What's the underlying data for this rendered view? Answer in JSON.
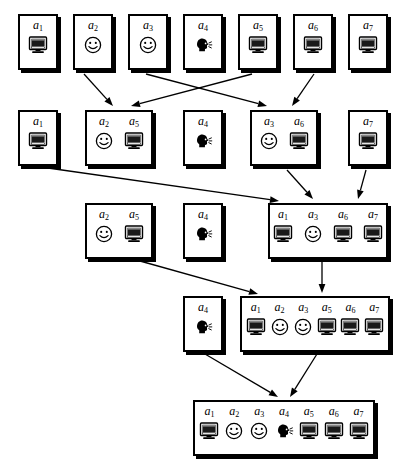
{
  "diagram": {
    "type": "clustering-dendrogram",
    "agents": [
      {
        "id": "a1",
        "label": "a",
        "sub": "1",
        "icon": "monitor-icon"
      },
      {
        "id": "a2",
        "label": "a",
        "sub": "2",
        "icon": "smiley-icon"
      },
      {
        "id": "a3",
        "label": "a",
        "sub": "3",
        "icon": "smiley-icon"
      },
      {
        "id": "a4",
        "label": "a",
        "sub": "4",
        "icon": "talking-head-icon"
      },
      {
        "id": "a5",
        "label": "a",
        "sub": "5",
        "icon": "monitor-icon"
      },
      {
        "id": "a6",
        "label": "a",
        "sub": "6",
        "icon": "monitor-icon"
      },
      {
        "id": "a7",
        "label": "a",
        "sub": "7",
        "icon": "monitor-icon"
      }
    ],
    "colors": {
      "stroke": "#000000",
      "fill": "#ffffff",
      "shadow": "#000000"
    },
    "levels": [
      {
        "level": 1,
        "y": 14,
        "height": 56,
        "clusters": [
          {
            "name": "cluster-a1",
            "x": 18,
            "width": 40,
            "members": [
              "a1"
            ]
          },
          {
            "name": "cluster-a2",
            "x": 73,
            "width": 40,
            "members": [
              "a2"
            ]
          },
          {
            "name": "cluster-a3",
            "x": 128,
            "width": 40,
            "members": [
              "a3"
            ]
          },
          {
            "name": "cluster-a4",
            "x": 183,
            "width": 40,
            "members": [
              "a4"
            ]
          },
          {
            "name": "cluster-a5",
            "x": 238,
            "width": 40,
            "members": [
              "a5"
            ]
          },
          {
            "name": "cluster-a6",
            "x": 293,
            "width": 40,
            "members": [
              "a6"
            ]
          },
          {
            "name": "cluster-a7",
            "x": 348,
            "width": 40,
            "members": [
              "a7"
            ]
          }
        ]
      },
      {
        "level": 2,
        "y": 110,
        "height": 56,
        "clusters": [
          {
            "name": "cluster-a1",
            "x": 18,
            "width": 40,
            "members": [
              "a1"
            ]
          },
          {
            "name": "cluster-a2-a5",
            "x": 85,
            "width": 68,
            "members": [
              "a2",
              "a5"
            ]
          },
          {
            "name": "cluster-a4",
            "x": 183,
            "width": 40,
            "members": [
              "a4"
            ]
          },
          {
            "name": "cluster-a3-a6",
            "x": 250,
            "width": 68,
            "members": [
              "a3",
              "a6"
            ]
          },
          {
            "name": "cluster-a7",
            "x": 348,
            "width": 40,
            "members": [
              "a7"
            ]
          }
        ]
      },
      {
        "level": 3,
        "y": 203,
        "height": 56,
        "clusters": [
          {
            "name": "cluster-a2-a5",
            "x": 85,
            "width": 68,
            "members": [
              "a2",
              "a5"
            ]
          },
          {
            "name": "cluster-a4",
            "x": 183,
            "width": 40,
            "members": [
              "a4"
            ]
          },
          {
            "name": "cluster-a1-a3-a6-a7",
            "x": 268,
            "width": 120,
            "members": [
              "a1",
              "a3",
              "a6",
              "a7"
            ]
          }
        ]
      },
      {
        "level": 4,
        "y": 296,
        "height": 56,
        "clusters": [
          {
            "name": "cluster-a4",
            "x": 183,
            "width": 40,
            "members": [
              "a4"
            ]
          },
          {
            "name": "cluster-a1-a2-a3-a5-a6-a7",
            "x": 240,
            "width": 150,
            "members": [
              "a1",
              "a2",
              "a3",
              "a5",
              "a6",
              "a7"
            ]
          }
        ]
      },
      {
        "level": 5,
        "y": 400,
        "height": 56,
        "clusters": [
          {
            "name": "cluster-all",
            "x": 193,
            "width": 182,
            "members": [
              "a1",
              "a2",
              "a3",
              "a4",
              "a5",
              "a6",
              "a7"
            ]
          }
        ]
      }
    ],
    "edges": [
      {
        "name": "edge-a2-to-a2a5",
        "from": "a2",
        "to": "a2-a5",
        "x1": 84,
        "y1": 74,
        "x2": 113,
        "y2": 106
      },
      {
        "name": "edge-a5-to-a2a5",
        "from": "a5",
        "to": "a2-a5",
        "x1": 252,
        "y1": 74,
        "x2": 131,
        "y2": 106
      },
      {
        "name": "edge-a3-to-a3a6",
        "from": "a3",
        "to": "a3-a6",
        "x1": 146,
        "y1": 74,
        "x2": 267,
        "y2": 106
      },
      {
        "name": "edge-a6-to-a3a6",
        "from": "a6",
        "to": "a3-a6",
        "x1": 314,
        "y1": 74,
        "x2": 292,
        "y2": 106
      },
      {
        "name": "edge-a1-to-a1a3a6a7",
        "from": "a1",
        "to": "a1-a3-a6-a7",
        "x1": 48,
        "y1": 168,
        "x2": 279,
        "y2": 201
      },
      {
        "name": "edge-a3a6-to-a1a3a6a7",
        "from": "a3-a6",
        "to": "a1-a3-a6-a7",
        "x1": 287,
        "y1": 170,
        "x2": 313,
        "y2": 199
      },
      {
        "name": "edge-a7-to-a1a3a6a7",
        "from": "a7",
        "to": "a1-a3-a6-a7",
        "x1": 366,
        "y1": 170,
        "x2": 358,
        "y2": 199
      },
      {
        "name": "edge-a2a5-to-big6",
        "from": "a2-a5",
        "to": "a1-a2-a3-a5-a6-a7",
        "x1": 140,
        "y1": 261,
        "x2": 258,
        "y2": 294
      },
      {
        "name": "edge-a1a3a6a7-to-big6",
        "from": "a1-a3-a6-a7",
        "to": "a1-a2-a3-a5-a6-a7",
        "x1": 322,
        "y1": 262,
        "x2": 322,
        "y2": 293
      },
      {
        "name": "edge-a4-to-all",
        "from": "a4",
        "to": "all",
        "x1": 205,
        "y1": 354,
        "x2": 278,
        "y2": 397
      },
      {
        "name": "edge-big6-to-all",
        "from": "a1-a2-a3-a5-a6-a7",
        "to": "all",
        "x1": 317,
        "y1": 354,
        "x2": 290,
        "y2": 397
      }
    ]
  }
}
